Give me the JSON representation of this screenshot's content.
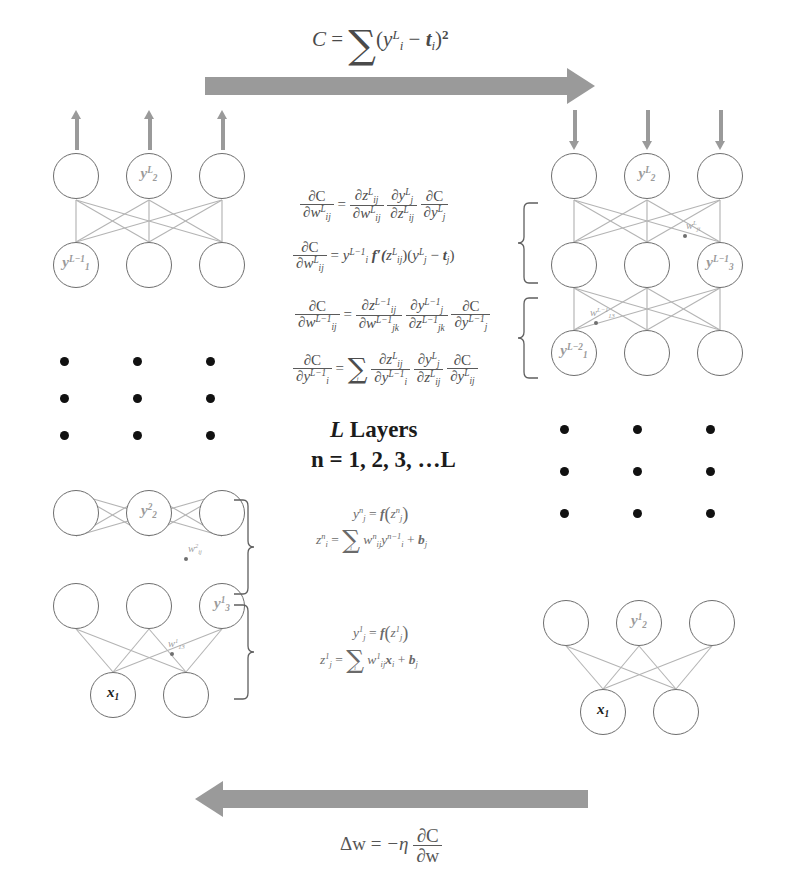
{
  "figure": {
    "center_label_layers": "L Layers",
    "center_label_index": "n = 1, 2, 3, …L"
  },
  "colors": {
    "arrow_gray": "#9a9a9a",
    "node_stroke": "#6e6e6e",
    "link_gray": "#b4b4b4",
    "label_gray": "#9a9a9a",
    "text_dark": "#1c1c1c",
    "background": "#ffffff"
  },
  "top_arrow": {
    "direction": "right",
    "formula_plain": "C = Σ (y_i^L − t_i)^2",
    "parts": {
      "lhs": "C",
      "eq": "=",
      "sum": "∑",
      "open": "(",
      "y": "y",
      "y_sup": "L",
      "y_sub": "i",
      "minus": "−",
      "t": "t",
      "t_sub": "i",
      "close": ")",
      "power": "2"
    }
  },
  "bottom_arrow": {
    "direction": "left",
    "formula_plain": "Δw = −η ∂C/∂w",
    "parts": {
      "delta_w": "Δw",
      "eq": "=",
      "minus_eta": "−η",
      "num": "∂C",
      "den": "∂w"
    }
  },
  "equations": {
    "block1": [
      {
        "id": "dC-dw-L-chain",
        "plain": "∂C/∂w_ij^L = (∂z_ij^L/∂w_ij^L)(∂y_j^L/∂z_ij^L)(∂C/∂y_j^L)",
        "lhs_num": "∂C",
        "lhs_den_base": "∂w",
        "lhs_den_sub": "ij",
        "lhs_den_sup": "L",
        "eq": "=",
        "t1_num_base": "∂z",
        "t1_num_sub": "ij",
        "t1_num_sup": "L",
        "t1_den_base": "∂w",
        "t1_den_sub": "ij",
        "t1_den_sup": "L",
        "t2_num_base": "∂y",
        "t2_num_sub": "j",
        "t2_num_sup": "L",
        "t2_den_base": "∂z",
        "t2_den_sub": "ij",
        "t2_den_sup": "L",
        "t3_num": "∂C",
        "t3_den_base": "∂y",
        "t3_den_sub": "j",
        "t3_den_sup": "L"
      },
      {
        "id": "dC-dw-L-expanded",
        "plain": "∂C/∂w_ij^L = y_i^{L−1} f′(z_ij^L)(y_j^L − t_j)",
        "lhs_num": "∂C",
        "lhs_den_base": "∂w",
        "lhs_den_sub": "ij",
        "lhs_den_sup": "L",
        "eq": "=",
        "rhs_y_base": "y",
        "rhs_y_sub": "i",
        "rhs_y_sup": "L−1",
        "rhs_fp": "f′(",
        "rhs_z_base": "z",
        "rhs_z_sub": "ij",
        "rhs_z_sup": "L",
        "rhs_mid": ")(",
        "rhs_y2_base": "y",
        "rhs_y2_sub": "j",
        "rhs_y2_sup": "L",
        "rhs_minus": "−",
        "rhs_t_base": "t",
        "rhs_t_sub": "j",
        "rhs_close": ")"
      }
    ],
    "block2": [
      {
        "id": "dC-dw-Lm1-chain",
        "plain": "∂C/∂w_ij^{L−1} = (∂z_ij^{L−1}/∂w_jk^{L−1})(∂y_j^{L−1}/∂z_jk^{L−1})(∂C/∂y_j^{L−1})",
        "lhs_num": "∂C",
        "lhs_den_base": "∂w",
        "lhs_den_sub": "ij",
        "lhs_den_sup": "L−1",
        "eq": "=",
        "t1_num_base": "∂z",
        "t1_num_sub": "ij",
        "t1_num_sup": "L−1",
        "t1_den_base": "∂w",
        "t1_den_sub": "jk",
        "t1_den_sup": "L−1",
        "t2_num_base": "∂y",
        "t2_num_sub": "j",
        "t2_num_sup": "L−1",
        "t2_den_base": "∂z",
        "t2_den_sub": "jk",
        "t2_den_sup": "L−1",
        "t3_num": "∂C",
        "t3_den_base": "∂y",
        "t3_den_sub": "j",
        "t3_den_sup": "L−1"
      },
      {
        "id": "dC-dy-Lm1-sum",
        "plain": "∂C/∂y_i^{L−1} = Σ_j (∂z_ij^L/∂y_i^{L−1})(∂y_j^L/∂z_ij^L)(∂C/∂y_ij^L)",
        "lhs_num": "∂C",
        "lhs_den_base": "∂y",
        "lhs_den_sub": "i",
        "lhs_den_sup": "L−1",
        "eq": "=",
        "sum": "∑",
        "sum_idx": "j",
        "t1_num_base": "∂z",
        "t1_num_sub": "ij",
        "t1_num_sup": "L",
        "t1_den_base": "∂y",
        "t1_den_sub": "i",
        "t1_den_sup": "L−1",
        "t2_num_base": "∂y",
        "t2_num_sub": "j",
        "t2_num_sup": "L",
        "t2_den_base": "∂z",
        "t2_den_sub": "ij",
        "t2_den_sup": "L",
        "t3_num": "∂C",
        "t3_den_base": "∂y",
        "t3_den_sub": "ij",
        "t3_den_sup": "L"
      }
    ],
    "block3": [
      {
        "id": "y-n",
        "plain": "y_j^n = f(z_j^n)",
        "lhs_base": "y",
        "lhs_sub": "j",
        "lhs_sup": "n",
        "eq": "=",
        "f": "f",
        "open": "(",
        "z_base": "z",
        "z_sub": "j",
        "z_sup": "n",
        "close": ")"
      },
      {
        "id": "z-n",
        "plain": "z_i^n = Σ_i w_ij^n y_i^{n−1} + b_j",
        "lhs_base": "z",
        "lhs_sub": "i",
        "lhs_sup": "n",
        "eq": "=",
        "sum": "∑",
        "sum_idx": "i",
        "w_base": "w",
        "w_sub": "ij",
        "w_sup": "n",
        "y_base": "y",
        "y_sub": "i",
        "y_sup": "n−1",
        "plus": "+",
        "b_base": "b",
        "b_sub": "j"
      }
    ],
    "block4": [
      {
        "id": "y-1",
        "plain": "y_j^1 = f(z_j^1)",
        "lhs_base": "y",
        "lhs_sub": "j",
        "lhs_sup": "1",
        "eq": "=",
        "f": "f",
        "open": "(",
        "z_base": "z",
        "z_sub": "j",
        "z_sup": "1",
        "close": ")"
      },
      {
        "id": "z-1",
        "plain": "z_j^1 = Σ_i w_ij^1 x_i + b_j",
        "lhs_base": "z",
        "lhs_sub": "j",
        "lhs_sup": "1",
        "eq": "=",
        "sum": "∑",
        "sum_idx": "i",
        "w_base": "w",
        "w_sub": "ij",
        "w_sup": "1",
        "x_base": "x",
        "x_sub": "i",
        "plus": "+",
        "b_base": "b",
        "b_sub": "j"
      }
    ]
  },
  "networks": [
    {
      "id": "top-left",
      "role": "forward-pass-output-layers",
      "arrow_direction": "up",
      "layers": [
        {
          "name": "layer-L",
          "nodes": [
            {
              "label": ""
            },
            {
              "label": "y",
              "sub": "2",
              "sup": "L"
            },
            {
              "label": ""
            }
          ]
        },
        {
          "name": "layer-L-1",
          "nodes": [
            {
              "label": "y",
              "sub": "1",
              "sup": "L−1"
            },
            {
              "label": ""
            },
            {
              "label": ""
            }
          ]
        }
      ],
      "weight_labels": []
    },
    {
      "id": "top-right",
      "role": "backward-pass-output-layers",
      "arrow_direction": "down",
      "layers": [
        {
          "name": "layer-L",
          "nodes": [
            {
              "label": ""
            },
            {
              "label": "y",
              "sub": "2",
              "sup": "L"
            },
            {
              "label": ""
            }
          ]
        },
        {
          "name": "layer-L-1",
          "nodes": [
            {
              "label": ""
            },
            {
              "label": ""
            },
            {
              "label": "y",
              "sub": "3",
              "sup": "L−1"
            }
          ]
        },
        {
          "name": "layer-L-2",
          "nodes": [
            {
              "label": "y",
              "sub": "1",
              "sup": "L−2"
            },
            {
              "label": ""
            },
            {
              "label": ""
            }
          ]
        }
      ],
      "weight_labels": [
        {
          "base": "w",
          "sub": "ji",
          "sup": "L"
        },
        {
          "base": "w",
          "sub": "13",
          "sup": "L−1"
        }
      ]
    },
    {
      "id": "bottom-left",
      "role": "forward-pass-input-layers",
      "arrow_direction": "up",
      "layers": [
        {
          "name": "layer-2",
          "nodes": [
            {
              "label": ""
            },
            {
              "label": "y",
              "sub": "2",
              "sup": "2"
            },
            {
              "label": ""
            }
          ]
        },
        {
          "name": "layer-1",
          "nodes": [
            {
              "label": ""
            },
            {
              "label": ""
            },
            {
              "label": "y",
              "sub": "3",
              "sup": "1"
            }
          ]
        },
        {
          "name": "layer-input",
          "nodes": [
            {
              "label": "x",
              "sub": "1",
              "dark": true
            },
            {
              "label": ""
            }
          ]
        }
      ],
      "weight_labels": [
        {
          "base": "w",
          "sub": "ij",
          "sup": "2"
        },
        {
          "base": "w",
          "sub": "13",
          "sup": "1"
        }
      ]
    },
    {
      "id": "bottom-right",
      "role": "backward-pass-input-layers",
      "arrow_direction": "down",
      "layers": [
        {
          "name": "layer-1",
          "nodes": [
            {
              "label": ""
            },
            {
              "label": "y",
              "sub": "2",
              "sup": "1"
            },
            {
              "label": ""
            }
          ]
        },
        {
          "name": "layer-input",
          "nodes": [
            {
              "label": "x",
              "sub": "1",
              "dark": true
            },
            {
              "label": ""
            }
          ]
        }
      ],
      "weight_labels": []
    }
  ],
  "ellipses": [
    {
      "id": "left-dots",
      "rows": 3,
      "cols": 3
    },
    {
      "id": "right-dots",
      "rows": 3,
      "cols": 3
    }
  ]
}
